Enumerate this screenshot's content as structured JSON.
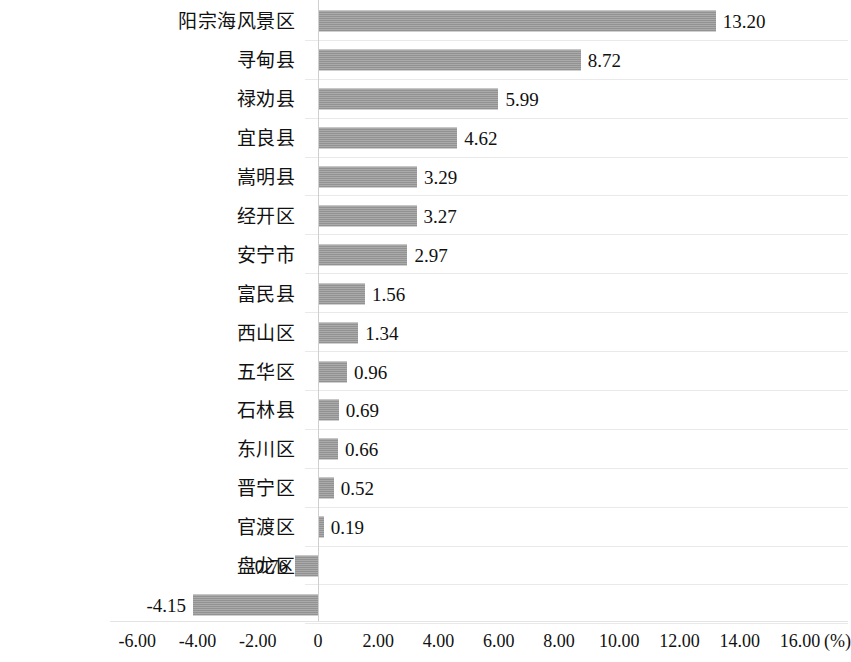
{
  "chart_data": {
    "type": "bar",
    "orientation": "horizontal",
    "title": "",
    "subtitle": "",
    "xlabel": "(%)",
    "ylabel": "",
    "unit_label": "(%)",
    "xlim": [
      -6,
      16
    ],
    "xticks": [
      -6,
      -4,
      -2,
      0,
      2,
      4,
      6,
      8,
      10,
      12,
      14,
      16
    ],
    "xtick_labels": [
      "-6.00",
      "-4.00",
      "-2.00",
      "0",
      "2.00",
      "4.00",
      "6.00",
      "8.00",
      "10.00",
      "12.00",
      "14.00",
      "16.00"
    ],
    "grid": "horizontal",
    "legend": "none",
    "bar_color": "#9a9a9a",
    "categories": [
      "阳宗海风景区",
      "寻甸县",
      "禄劝县",
      "宜良县",
      "嵩明县",
      "经开区",
      "安宁市",
      "富民县",
      "西山区",
      "五华区",
      "石林县",
      "东川区",
      "晋宁区",
      "官渡区",
      "盘龙区",
      "呈贡区"
    ],
    "values": [
      13.2,
      8.72,
      5.99,
      4.62,
      3.29,
      3.27,
      2.97,
      1.56,
      1.34,
      0.96,
      0.69,
      0.66,
      0.52,
      0.19,
      -0.76,
      -4.15
    ],
    "value_labels": [
      "13.20",
      "8.72",
      "5.99",
      "4.62",
      "3.29",
      "3.27",
      "2.97",
      "1.56",
      "1.34",
      "0.96",
      "0.69",
      "0.66",
      "0.52",
      "0.19",
      "-0.76",
      "-4.15"
    ]
  }
}
